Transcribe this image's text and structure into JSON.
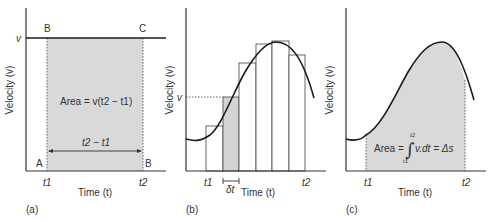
{
  "panels": {
    "a": {
      "label": "(a)",
      "ylabel": "Velocity (v)",
      "xlabel": "Time (t)",
      "v_label": "v",
      "corner_labels": {
        "top_left": "B",
        "top_right": "C",
        "bottom_left": "A",
        "bottom_right": "B"
      },
      "t1": "t1",
      "t2": "t2",
      "area_label": "Area = v(t2 − t1)",
      "interval_label": "t2 − t1"
    },
    "b": {
      "label": "(b)",
      "ylabel": "Velocity (v)",
      "xlabel": "Time (t)",
      "v_label": "v",
      "t1": "t1",
      "t2": "t2",
      "dt_label": "δt",
      "bars_count": 6,
      "highlighted_bar": 2
    },
    "c": {
      "label": "(c)",
      "ylabel": "Velocity (v)",
      "xlabel": "Time (t)",
      "t1": "t1",
      "t2": "t2",
      "area_label": "Area = ∫ v.dt = Δs",
      "integral_lower": "t1",
      "integral_upper": "t2"
    }
  },
  "colors": {
    "shade": "#d9d9d9",
    "line": "#1a1a1a",
    "axis": "#333333"
  }
}
